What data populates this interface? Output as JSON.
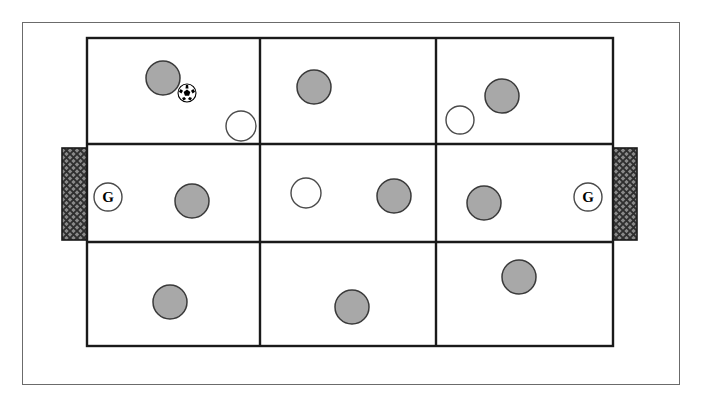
{
  "diagram": {
    "type": "sports-field-diagram",
    "sport": "soccer",
    "grid": {
      "columns": 3,
      "rows": 3,
      "total_zones": 9
    },
    "colors": {
      "field_fill": "#ffffff",
      "field_line": "#1a1a1a",
      "outer_frame_line": "#6b6b6b",
      "gray_player_fill": "#a8a8a8",
      "gray_player_stroke": "#3a3a3a",
      "white_player_fill": "#ffffff",
      "white_player_stroke": "#4a4a4a",
      "goal_fill": "#8a8a8a",
      "goal_hatch": "#2e2e2e",
      "goal_stroke": "#1a1a1a",
      "ball_white": "#ffffff",
      "ball_black": "#000000"
    },
    "geometry": {
      "outer_frame": {
        "x": 22,
        "y": 22,
        "width": 658,
        "height": 363
      },
      "field": {
        "x": 87,
        "y": 38,
        "width": 526,
        "height": 308
      },
      "vertical_dividers_x": [
        260,
        436
      ],
      "horizontal_dividers_y": [
        144,
        242
      ],
      "field_line_width": 2.4,
      "outer_frame_line_width": 1
    },
    "goals": [
      {
        "name": "left-goal",
        "side": "left",
        "x": 62,
        "y": 148,
        "width": 26,
        "height": 92,
        "hatch_pattern": "cross-hatch"
      },
      {
        "name": "right-goal",
        "side": "right",
        "x": 611,
        "y": 148,
        "width": 26,
        "height": 92,
        "hatch_pattern": "cross-hatch"
      }
    ],
    "goalkeepers": [
      {
        "name": "left-goalkeeper",
        "label": "G",
        "cx": 108,
        "cy": 197,
        "r": 14
      },
      {
        "name": "right-goalkeeper",
        "label": "G",
        "cx": 588,
        "cy": 197,
        "r": 14
      }
    ],
    "ball": {
      "name": "soccer-ball",
      "cx": 187,
      "cy": 93,
      "r": 9
    },
    "players": [
      {
        "team": "gray",
        "zone": "top-left",
        "cx": 163,
        "cy": 78,
        "r": 17
      },
      {
        "team": "white",
        "zone": "top-left",
        "cx": 241,
        "cy": 126,
        "r": 15
      },
      {
        "team": "gray",
        "zone": "top-center",
        "cx": 314,
        "cy": 87,
        "r": 17
      },
      {
        "team": "white",
        "zone": "top-right",
        "cx": 460,
        "cy": 120,
        "r": 14
      },
      {
        "team": "gray",
        "zone": "top-right",
        "cx": 502,
        "cy": 96,
        "r": 17
      },
      {
        "team": "gray",
        "zone": "middle-left",
        "cx": 192,
        "cy": 201,
        "r": 17
      },
      {
        "team": "white",
        "zone": "middle-center",
        "cx": 306,
        "cy": 193,
        "r": 15
      },
      {
        "team": "gray",
        "zone": "middle-center",
        "cx": 394,
        "cy": 196,
        "r": 17
      },
      {
        "team": "gray",
        "zone": "middle-right",
        "cx": 484,
        "cy": 203,
        "r": 17
      },
      {
        "team": "gray",
        "zone": "bottom-left",
        "cx": 170,
        "cy": 302,
        "r": 17
      },
      {
        "team": "gray",
        "zone": "bottom-center",
        "cx": 352,
        "cy": 307,
        "r": 17
      },
      {
        "team": "gray",
        "zone": "bottom-right",
        "cx": 519,
        "cy": 277,
        "r": 17
      }
    ],
    "legend_counts": {
      "gray_players": 9,
      "white_players": 3,
      "goalkeepers": 2,
      "balls": 1
    }
  }
}
